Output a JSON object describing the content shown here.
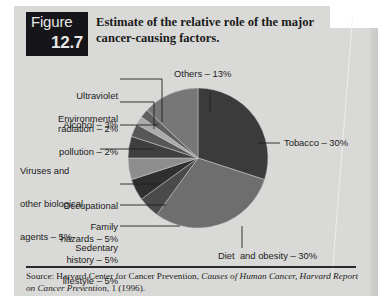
{
  "figure": {
    "badge_word": "Figure",
    "badge_number": "12.7",
    "title": "Estimate of the relative role of the major cancer-causing factors."
  },
  "source": {
    "prefix": "Source:  Harvard Center for Cancer Prevention, ",
    "italic_title": "Causes of Human Cancer, Harvard Report on Cancer Prevention",
    "suffix": ", 1 (1996)."
  },
  "colors": {
    "panel": "#d9d9d7",
    "badge_bg": "#16161a",
    "badge_text": "#e8e8e6",
    "text": "#1c1c1c",
    "leader": "#202020"
  },
  "chart_data": {
    "type": "pie",
    "title": "Estimate of the relative role of the major cancer-causing factors.",
    "unit": "%",
    "total": 100,
    "legend_position": "callout-labels",
    "categories": [
      "Tobacco",
      "Diet and obesity",
      "Sedentary lifestyle",
      "Family history",
      "Occupational hazards",
      "Viruses and other biological agents",
      "Alcohol",
      "Environmental pollution",
      "Ultraviolet radiation",
      "Others"
    ],
    "values": [
      30,
      30,
      5,
      5,
      5,
      5,
      3,
      2,
      2,
      13
    ],
    "slices": [
      {
        "label": "Tobacco – 30%",
        "name": "Tobacco",
        "value": 30,
        "color": "#3b3b3b"
      },
      {
        "label": "Diet  and obesity – 30%",
        "name": "Diet and obesity",
        "value": 30,
        "color": "#6e6e6e"
      },
      {
        "label": "Sedentary lifestyle – 5%",
        "name": "Sedentary lifestyle",
        "value": 5,
        "color": "#4a4a4a"
      },
      {
        "label": "Family history – 5%",
        "name": "Family history",
        "value": 5,
        "color": "#2f2f2f"
      },
      {
        "label": "Occupational hazards – 5%",
        "name": "Occupational hazards",
        "value": 5,
        "color": "#8e8e8e"
      },
      {
        "label": "Viruses and other biological agents – 5%",
        "name": "Viruses and other biological agents",
        "value": 5,
        "color": "#3f3f3f"
      },
      {
        "label": "Alcohol – 3%",
        "name": "Alcohol",
        "value": 3,
        "color": "#575757"
      },
      {
        "label": "Environmental pollution – 2%",
        "name": "Environmental pollution",
        "value": 2,
        "color": "#aaaaaa"
      },
      {
        "label": "Ultraviolet radiation – 2%",
        "name": "Ultraviolet radiation",
        "value": 2,
        "color": "#5f5f5f"
      },
      {
        "label": "Others – 13%",
        "name": "Others",
        "value": 13,
        "color": "#777777"
      }
    ]
  },
  "labels": {
    "others": "Others – 13%",
    "tobacco": "Tobacco – 30%",
    "diet": "Diet  and obesity – 30%",
    "uv_l1": "Ultraviolet",
    "uv_l2": "radiation – 2%",
    "env_l1": "Environmental",
    "env_l2": "pollution – 2%",
    "alcohol": "Alcohol – 3%",
    "virus_l1": "Viruses and",
    "virus_l2": "other biological",
    "virus_l3": "agents – 5%",
    "occ_l1": "Occupational",
    "occ_l2": "hazards – 5%",
    "fam_l1": "Family",
    "fam_l2": "history – 5%",
    "sed_l1": "Sedentary",
    "sed_l2": "lifestyle – 5%"
  }
}
